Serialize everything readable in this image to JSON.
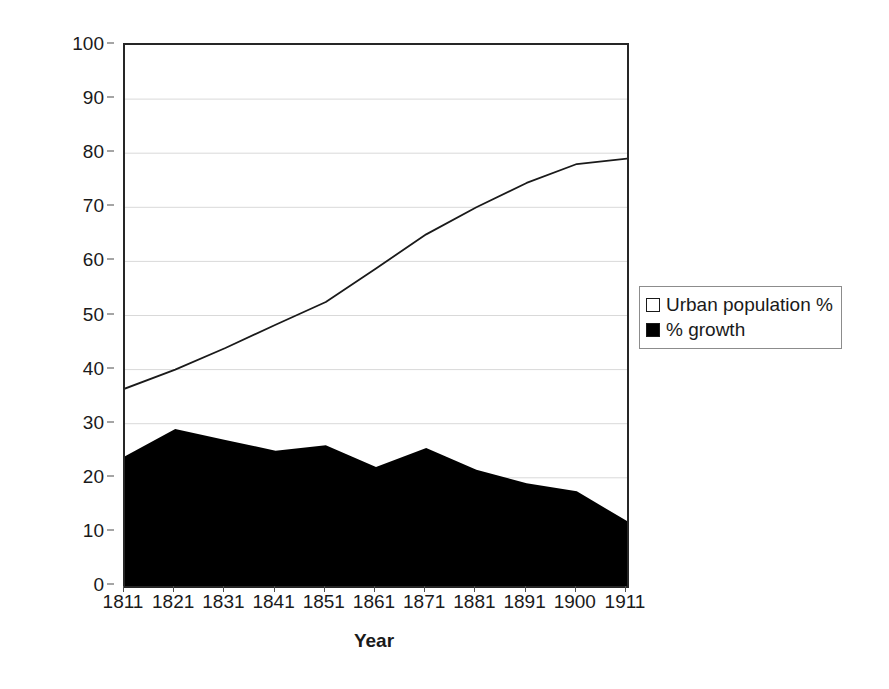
{
  "chart_data": {
    "type": "area",
    "title": "",
    "xlabel": "Year",
    "ylabel": "Urban population % and growth",
    "categories": [
      "1811",
      "1821",
      "1831",
      "1841",
      "1851",
      "1861",
      "1871",
      "1881",
      "1891",
      "1900",
      "1911"
    ],
    "ylim": [
      0,
      100
    ],
    "ytick_values": [
      "100",
      "90",
      "80",
      "70",
      "60",
      "50",
      "40",
      "30",
      "20",
      "10",
      "0"
    ],
    "grid": true,
    "legend_position": "right-outside",
    "series": [
      {
        "name": "Urban population %",
        "render": "line",
        "color": "#1a1a1a",
        "marker": "hollow-square",
        "values": [
          36.5,
          40.0,
          44.0,
          48.3,
          52.5,
          58.7,
          65.0,
          70.0,
          74.5,
          78.0,
          79.0
        ]
      },
      {
        "name": "% growth",
        "render": "filled-area",
        "color": "#000000",
        "marker": "filled-square",
        "values": [
          24.0,
          29.0,
          27.0,
          25.0,
          26.0,
          22.0,
          25.5,
          21.5,
          19.0,
          17.5,
          12.0
        ]
      }
    ]
  },
  "legend": {
    "items": [
      {
        "label": "Urban population %",
        "swatch": "hollow"
      },
      {
        "label": "% growth",
        "swatch": "filled"
      }
    ]
  }
}
